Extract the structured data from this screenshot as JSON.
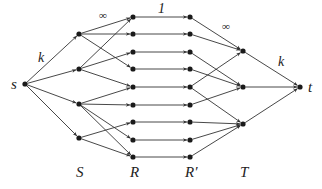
{
  "diagram": {
    "type": "flow-network",
    "colors": {
      "edge": "#333333",
      "node": "#1a1a1a",
      "text": "#222222"
    },
    "nodes": {
      "source": {
        "id": "s",
        "label": "s",
        "x": 25,
        "y": 84
      },
      "sink": {
        "id": "t",
        "label": "t",
        "x": 300,
        "y": 87
      },
      "S": [
        {
          "id": "S1",
          "x": 79,
          "y": 34
        },
        {
          "id": "S2",
          "x": 79,
          "y": 69
        },
        {
          "id": "S3",
          "x": 79,
          "y": 104
        },
        {
          "id": "S4",
          "x": 79,
          "y": 138
        }
      ],
      "R": [
        {
          "id": "R1",
          "x": 133,
          "y": 17
        },
        {
          "id": "R2",
          "x": 133,
          "y": 34
        },
        {
          "id": "R3",
          "x": 133,
          "y": 52
        },
        {
          "id": "R4",
          "x": 133,
          "y": 69
        },
        {
          "id": "R5",
          "x": 133,
          "y": 87
        },
        {
          "id": "R6",
          "x": 133,
          "y": 105
        },
        {
          "id": "R7",
          "x": 133,
          "y": 122
        },
        {
          "id": "R8",
          "x": 133,
          "y": 140
        },
        {
          "id": "R9",
          "x": 133,
          "y": 157
        }
      ],
      "Rp": [
        {
          "id": "Rp1",
          "x": 190,
          "y": 17
        },
        {
          "id": "Rp2",
          "x": 190,
          "y": 34
        },
        {
          "id": "Rp3",
          "x": 190,
          "y": 52
        },
        {
          "id": "Rp4",
          "x": 190,
          "y": 69
        },
        {
          "id": "Rp5",
          "x": 190,
          "y": 87
        },
        {
          "id": "Rp6",
          "x": 190,
          "y": 105
        },
        {
          "id": "Rp7",
          "x": 190,
          "y": 122
        },
        {
          "id": "Rp8",
          "x": 190,
          "y": 140
        },
        {
          "id": "Rp9",
          "x": 190,
          "y": 157
        }
      ],
      "T": [
        {
          "id": "T1",
          "x": 243,
          "y": 51
        },
        {
          "id": "T2",
          "x": 243,
          "y": 87
        },
        {
          "id": "T3",
          "x": 243,
          "y": 124
        }
      ]
    },
    "edges": {
      "s_to_S": [
        [
          "s",
          "S1"
        ],
        [
          "s",
          "S2"
        ],
        [
          "s",
          "S3"
        ],
        [
          "s",
          "S4"
        ]
      ],
      "S_to_R": [
        [
          "S1",
          "R1"
        ],
        [
          "S1",
          "R2"
        ],
        [
          "S1",
          "R4"
        ],
        [
          "S2",
          "R1"
        ],
        [
          "S2",
          "R3"
        ],
        [
          "S2",
          "R5"
        ],
        [
          "S3",
          "R5"
        ],
        [
          "S3",
          "R6"
        ],
        [
          "S3",
          "R8"
        ],
        [
          "S3",
          "R9"
        ],
        [
          "S4",
          "R7"
        ],
        [
          "S4",
          "R9"
        ]
      ],
      "R_to_Rp": [
        [
          "R1",
          "Rp1"
        ],
        [
          "R2",
          "Rp2"
        ],
        [
          "R3",
          "Rp3"
        ],
        [
          "R4",
          "Rp4"
        ],
        [
          "R5",
          "Rp5"
        ],
        [
          "R6",
          "Rp6"
        ],
        [
          "R7",
          "Rp7"
        ],
        [
          "R8",
          "Rp8"
        ],
        [
          "R9",
          "Rp9"
        ]
      ],
      "Rp_to_T": [
        [
          "Rp1",
          "T1"
        ],
        [
          "Rp2",
          "T1"
        ],
        [
          "Rp5",
          "T1"
        ],
        [
          "Rp3",
          "T2"
        ],
        [
          "Rp4",
          "T2"
        ],
        [
          "Rp6",
          "T2"
        ],
        [
          "Rp5",
          "T3"
        ],
        [
          "Rp7",
          "T3"
        ],
        [
          "Rp8",
          "T3"
        ],
        [
          "Rp9",
          "T3"
        ]
      ],
      "T_to_t": [
        [
          "T1",
          "t"
        ],
        [
          "T2",
          "t"
        ],
        [
          "T3",
          "t"
        ]
      ]
    },
    "capacity_labels": [
      {
        "text": "k",
        "x": 38,
        "y": 62,
        "size": 14
      },
      {
        "text": "∞",
        "x": 99,
        "y": 19,
        "size": 11
      },
      {
        "text": "1",
        "x": 158,
        "y": 13,
        "size": 14,
        "italic": false
      },
      {
        "text": "∞",
        "x": 222,
        "y": 30,
        "size": 11
      },
      {
        "text": "k",
        "x": 278,
        "y": 66,
        "size": 14
      }
    ],
    "node_labels": [
      {
        "text": "s",
        "x": 11,
        "y": 89
      },
      {
        "text": "t",
        "x": 308,
        "y": 92
      }
    ],
    "layer_labels": [
      {
        "text": "S",
        "x": 76,
        "y": 177
      },
      {
        "text": "R",
        "x": 130,
        "y": 177
      },
      {
        "text": "R′",
        "x": 185,
        "y": 177
      },
      {
        "text": "T",
        "x": 240,
        "y": 177
      }
    ]
  }
}
